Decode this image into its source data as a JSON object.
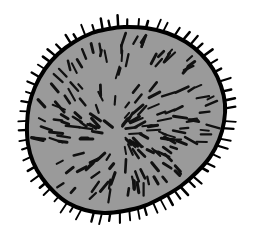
{
  "figure": {
    "domain_note": "scientific line drawing",
    "background_color": "#ffffff",
    "body_fill_color": "#9a9a9a",
    "outline_color": "#000000",
    "hair_color": "#111111",
    "spine_color": "#000000",
    "outline_width_px": 4,
    "canvas": {
      "width": 253,
      "height": 236
    }
  },
  "chart_data": {
    "type": "scatter",
    "xlabel": "",
    "ylabel": "",
    "xlim": [
      0,
      253
    ],
    "ylim": [
      0,
      236
    ],
    "grid": false,
    "legend": "none",
    "body": {
      "center": [
        124,
        120
      ],
      "radius_x": 98,
      "radius_y": 92,
      "bounds": {
        "left": 27,
        "right": 225,
        "top": 27,
        "bottom": 213
      },
      "outline_points": [
        [
          124,
          27
        ],
        [
          146,
          28
        ],
        [
          167,
          33
        ],
        [
          186,
          42
        ],
        [
          201,
          54
        ],
        [
          213,
          69
        ],
        [
          221,
          86
        ],
        [
          225,
          104
        ],
        [
          224,
          122
        ],
        [
          219,
          140
        ],
        [
          210,
          157
        ],
        [
          197,
          172
        ],
        [
          181,
          186
        ],
        [
          163,
          197
        ],
        [
          144,
          206
        ],
        [
          124,
          211
        ],
        [
          104,
          213
        ],
        [
          85,
          210
        ],
        [
          68,
          203
        ],
        [
          54,
          192
        ],
        [
          42,
          178
        ],
        [
          33,
          162
        ],
        [
          28,
          144
        ],
        [
          27,
          125
        ],
        [
          29,
          106
        ],
        [
          35,
          87
        ],
        [
          45,
          69
        ],
        [
          58,
          54
        ],
        [
          74,
          42
        ],
        [
          92,
          33
        ],
        [
          108,
          29
        ]
      ]
    },
    "hair_origin": [
      120,
      134
    ],
    "interior_hair_count": 170,
    "marginal_spine_count": 66,
    "hair_length_range_px": [
      6,
      14
    ],
    "spine_length_range_px": [
      7,
      13
    ]
  }
}
